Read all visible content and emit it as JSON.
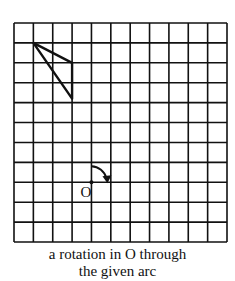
{
  "figure": {
    "grid": {
      "cols": 11,
      "rows": 11,
      "x0": 14,
      "y0": 23,
      "x1": 227,
      "y1": 242
    },
    "triangle": {
      "points": [
        [
          1,
          1
        ],
        [
          3,
          2
        ],
        [
          3,
          3.8
        ]
      ]
    },
    "center": {
      "label": "O",
      "col": 4,
      "row": 8
    },
    "arc": {
      "direction": "clockwise",
      "angle_deg": 90
    },
    "caption_line1": "a rotation in O through",
    "caption_line2": "the given arc"
  }
}
